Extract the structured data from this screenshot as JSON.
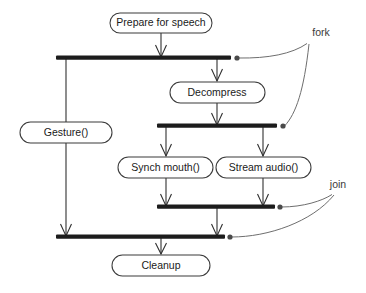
{
  "diagram": {
    "canvas": {
      "width": 366,
      "height": 293,
      "background": "#ffffff"
    },
    "colors": {
      "node_stroke": "#3b3b3b",
      "node_fill": "#ffffff",
      "flow_line": "#303030",
      "bar_fill": "#1c1c1c",
      "annotation_curve": "#6e6e6e",
      "annotation_dot": "#4a4a4a",
      "text": "#1a1a1a"
    },
    "activities": [
      {
        "id": "prepare",
        "label": "Prepare for speech",
        "x": 110,
        "y": 13,
        "w": 102,
        "h": 20,
        "cx": 161,
        "cy": 23
      },
      {
        "id": "gesture",
        "label": "Gesture()",
        "x": 20,
        "y": 122,
        "w": 92,
        "h": 21,
        "cx": 66,
        "cy": 132
      },
      {
        "id": "decompress",
        "label": "Decompress",
        "x": 170,
        "y": 82,
        "w": 95,
        "h": 21,
        "cx": 217,
        "cy": 92
      },
      {
        "id": "synch_mouth",
        "label": "Synch mouth()",
        "x": 118,
        "y": 157,
        "w": 95,
        "h": 21,
        "cx": 166,
        "cy": 167
      },
      {
        "id": "stream_audio",
        "label": "Stream audio()",
        "x": 216,
        "y": 157,
        "w": 95,
        "h": 21,
        "cx": 263,
        "cy": 167
      },
      {
        "id": "cleanup",
        "label": "Cleanup",
        "x": 112,
        "y": 255,
        "w": 98,
        "h": 21,
        "cx": 161,
        "cy": 265
      }
    ],
    "bars": [
      {
        "id": "fork-bar-1",
        "kind": "fork",
        "x1": 56,
        "x2": 231,
        "y": 58
      },
      {
        "id": "fork-bar-2",
        "kind": "fork",
        "x1": 157,
        "x2": 277,
        "y": 126
      },
      {
        "id": "join-bar-1",
        "kind": "join",
        "x1": 157,
        "x2": 275,
        "y": 207
      },
      {
        "id": "join-bar-2",
        "kind": "join",
        "x1": 56,
        "x2": 225,
        "y": 237
      }
    ],
    "annotations": [
      {
        "id": "fork-label",
        "label": "fork",
        "x": 321,
        "y": 33
      },
      {
        "id": "join-label",
        "label": "join",
        "x": 338,
        "y": 185
      }
    ],
    "annotation_dots": [
      {
        "id": "fork-dot-1",
        "x": 237,
        "y": 58
      },
      {
        "id": "fork-dot-2",
        "x": 283,
        "y": 126
      },
      {
        "id": "join-dot-1",
        "x": 280,
        "y": 207
      },
      {
        "id": "join-dot-2",
        "x": 230,
        "y": 237
      }
    ],
    "flows": [
      {
        "id": "flow-prepare-to-fork1",
        "from": "prepare",
        "to": "fork-bar-1"
      },
      {
        "id": "flow-fork1-to-gesture",
        "from": "fork-bar-1",
        "to": "gesture"
      },
      {
        "id": "flow-fork1-to-decompress",
        "from": "fork-bar-1",
        "to": "decompress"
      },
      {
        "id": "flow-decompress-to-fork2",
        "from": "decompress",
        "to": "fork-bar-2"
      },
      {
        "id": "flow-fork2-to-synch-mouth",
        "from": "fork-bar-2",
        "to": "synch_mouth"
      },
      {
        "id": "flow-fork2-to-stream-audio",
        "from": "fork-bar-2",
        "to": "stream_audio"
      },
      {
        "id": "flow-synch-mouth-to-join1",
        "from": "synch_mouth",
        "to": "join-bar-1"
      },
      {
        "id": "flow-stream-audio-to-join1",
        "from": "stream_audio",
        "to": "join-bar-1"
      },
      {
        "id": "flow-join1-to-join2",
        "from": "join-bar-1",
        "to": "join-bar-2"
      },
      {
        "id": "flow-gesture-to-join2",
        "from": "gesture",
        "to": "join-bar-2"
      },
      {
        "id": "flow-join2-to-cleanup",
        "from": "join-bar-2",
        "to": "cleanup"
      }
    ]
  }
}
